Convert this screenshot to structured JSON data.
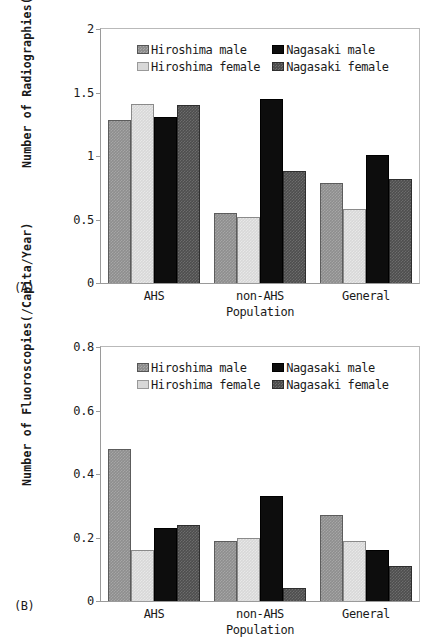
{
  "figure": {
    "background": "#ffffff",
    "series_colors": [
      "#8e8e8e",
      "#d8d8d8",
      "#0d0d0d",
      "#4e4e4e"
    ]
  },
  "panels": [
    {
      "letter": "(A)",
      "ylabel": "Number of Radiographies(/Capita/Year)",
      "xlabel": "Population",
      "yticks": [
        "0",
        "0.5",
        "1",
        "1.5",
        "2"
      ]
    },
    {
      "letter": "(B)",
      "ylabel": "Number of Fluoroscopies(/Capita/Year)",
      "xlabel": "Population",
      "yticks": [
        "0",
        "0.2",
        "0.4",
        "0.6",
        "0.8"
      ]
    }
  ],
  "legend": {
    "entries": [
      {
        "label": "Hiroshima male",
        "swatch": "series-0-swatch"
      },
      {
        "label": "Nagasaki male",
        "swatch": "series-2-swatch"
      },
      {
        "label": "Hiroshima female",
        "swatch": "series-1-swatch"
      },
      {
        "label": "Nagasaki female",
        "swatch": "series-3-swatch"
      }
    ]
  },
  "chart_data": [
    {
      "type": "bar",
      "panel": "(A)",
      "title": "",
      "xlabel": "Population",
      "ylabel": "Number of Radiographies(/Capita/Year)",
      "categories": [
        "AHS",
        "non-AHS",
        "General"
      ],
      "ylim": [
        0,
        2
      ],
      "yticks": [
        0,
        0.5,
        1,
        1.5,
        2
      ],
      "grid": false,
      "legend_position": "upper-center-inside",
      "series": [
        {
          "name": "Hiroshima male",
          "values": [
            1.28,
            0.55,
            0.79
          ]
        },
        {
          "name": "Hiroshima female",
          "values": [
            1.41,
            0.52,
            0.58
          ]
        },
        {
          "name": "Nagasaki male",
          "values": [
            1.31,
            1.45,
            1.01
          ]
        },
        {
          "name": "Nagasaki female",
          "values": [
            1.4,
            0.88,
            0.82
          ]
        }
      ]
    },
    {
      "type": "bar",
      "panel": "(B)",
      "title": "",
      "xlabel": "Population",
      "ylabel": "Number of Fluoroscopies(/Capita/Year)",
      "categories": [
        "AHS",
        "non-AHS",
        "General"
      ],
      "ylim": [
        0,
        0.8
      ],
      "yticks": [
        0,
        0.2,
        0.4,
        0.6,
        0.8
      ],
      "grid": false,
      "legend_position": "upper-center-inside",
      "series": [
        {
          "name": "Hiroshima male",
          "values": [
            0.48,
            0.19,
            0.27
          ]
        },
        {
          "name": "Hiroshima female",
          "values": [
            0.16,
            0.2,
            0.19
          ]
        },
        {
          "name": "Nagasaki male",
          "values": [
            0.23,
            0.33,
            0.16
          ]
        },
        {
          "name": "Nagasaki female",
          "values": [
            0.24,
            0.04,
            0.11
          ]
        }
      ]
    }
  ]
}
